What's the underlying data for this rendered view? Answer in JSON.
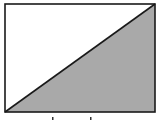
{
  "diagram": {
    "colors": {
      "outline": "#1a1a1a",
      "shaded_fill": "#a9a9a9",
      "unshaded_fill": "#ffffff"
    },
    "regions": [
      {
        "name": "upper-left-triangle",
        "shaded": false
      },
      {
        "name": "lower-right-triangle",
        "shaded": true
      }
    ],
    "marks_below": 2
  }
}
